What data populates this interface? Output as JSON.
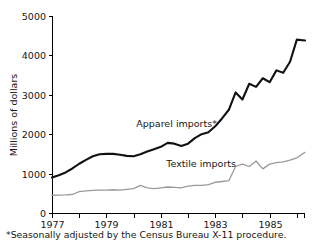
{
  "chart_data": {
    "type": "line",
    "title": "",
    "xlabel": "",
    "ylabel": "Millions of dollars",
    "xlim": [
      1977.0,
      1986.3
    ],
    "ylim": [
      0,
      5000
    ],
    "grid": false,
    "legend_position": "inline-annotation",
    "y_ticks": [
      0,
      1000,
      2000,
      3000,
      4000,
      5000
    ],
    "y_tick_labels": [
      "0",
      "1000",
      "2000",
      "3000",
      "4000",
      "5000"
    ],
    "x_ticks": [
      1977,
      1978,
      1979,
      1980,
      1981,
      1982,
      1983,
      1984,
      1985,
      1986
    ],
    "x_tick_labels": [
      "1977",
      "",
      "1979",
      "",
      "1981",
      "",
      "1983",
      "",
      "1985",
      ""
    ],
    "x_labeled_ticks": [
      {
        "x": 1977,
        "label": "1977"
      },
      {
        "x": 1979,
        "label": "1979"
      },
      {
        "x": 1981,
        "label": "1981"
      },
      {
        "x": 1983,
        "label": "1983"
      },
      {
        "x": 1985,
        "label": "1985"
      }
    ],
    "annotations": [
      {
        "name": "apparel-series-label",
        "text": "Apparel imports*",
        "x": 1980.1,
        "y": 2180
      },
      {
        "name": "textile-series-label",
        "text": "Textile imports",
        "x": 1981.2,
        "y": 1160
      }
    ],
    "footnote": "*Seasonally adjusted by the Census Bureau X-11 procedure.",
    "colors": {
      "apparel": "#111111",
      "textile": "#9a9a9a",
      "axis": "#000000",
      "background": "#ffffff"
    },
    "series": [
      {
        "name": "Apparel imports",
        "color": "#111111",
        "x": [
          1977.0,
          1977.25,
          1977.5,
          1977.75,
          1978.0,
          1978.25,
          1978.5,
          1978.75,
          1979.0,
          1979.25,
          1979.5,
          1979.75,
          1980.0,
          1980.25,
          1980.5,
          1980.75,
          1981.0,
          1981.25,
          1981.5,
          1981.75,
          1982.0,
          1982.25,
          1982.5,
          1982.75,
          1983.0,
          1983.25,
          1983.5,
          1983.75,
          1984.0,
          1984.25,
          1984.5,
          1984.75,
          1985.0,
          1985.25,
          1985.5,
          1985.75,
          1986.0,
          1986.3
        ],
        "values": [
          900,
          960,
          1030,
          1130,
          1250,
          1350,
          1440,
          1490,
          1500,
          1500,
          1480,
          1450,
          1440,
          1490,
          1560,
          1620,
          1680,
          1780,
          1760,
          1700,
          1760,
          1900,
          2000,
          2050,
          2200,
          2400,
          2620,
          3060,
          2880,
          3280,
          3200,
          3420,
          3320,
          3620,
          3560,
          3840,
          4400,
          4380
        ]
      },
      {
        "name": "Textile imports",
        "color": "#9a9a9a",
        "x": [
          1977.0,
          1977.25,
          1977.5,
          1977.75,
          1978.0,
          1978.25,
          1978.5,
          1978.75,
          1979.0,
          1979.25,
          1979.5,
          1979.75,
          1980.0,
          1980.25,
          1980.5,
          1980.75,
          1981.0,
          1981.25,
          1981.5,
          1981.75,
          1982.0,
          1982.25,
          1982.5,
          1982.75,
          1983.0,
          1983.25,
          1983.5,
          1983.75,
          1984.0,
          1984.25,
          1984.5,
          1984.75,
          1985.0,
          1985.25,
          1985.5,
          1985.75,
          1986.0,
          1986.3
        ],
        "values": [
          450,
          455,
          460,
          470,
          540,
          560,
          575,
          580,
          580,
          590,
          580,
          600,
          620,
          700,
          640,
          620,
          640,
          660,
          650,
          640,
          680,
          700,
          700,
          720,
          780,
          800,
          820,
          1180,
          1240,
          1180,
          1320,
          1120,
          1240,
          1280,
          1300,
          1340,
          1400,
          1540
        ]
      }
    ]
  }
}
